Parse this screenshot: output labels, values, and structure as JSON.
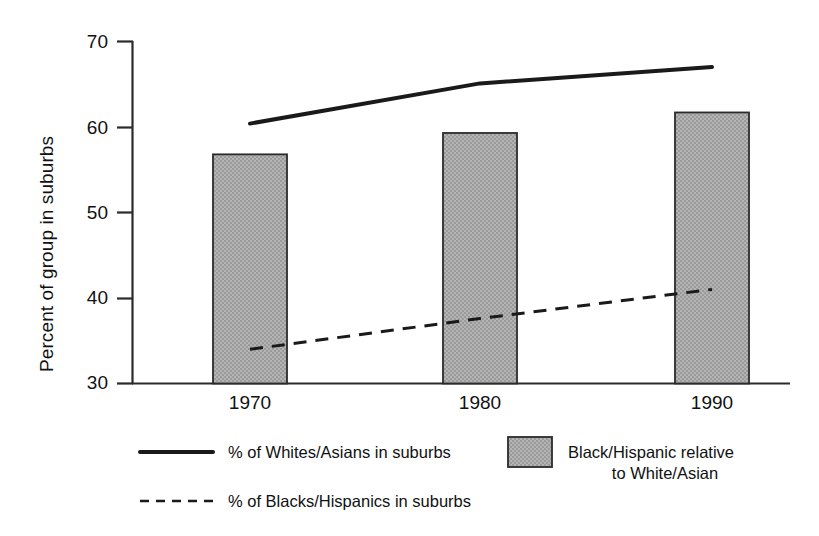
{
  "chart_data": {
    "type": "bar",
    "title": "",
    "subtitle": "",
    "xlabel": "",
    "ylabel": "Percent of group in suburbs",
    "categories": [
      "1970",
      "1980",
      "1990"
    ],
    "ylim": [
      30,
      70
    ],
    "yticks": [
      30,
      40,
      50,
      60,
      70
    ],
    "ytick_labels": [
      "30",
      "40",
      "50",
      "60",
      "70"
    ],
    "grid": false,
    "legend_position": "bottom",
    "series": [
      {
        "name": "Black/Hispanic relative to White/Asian",
        "type": "bar",
        "values": [
          56.8,
          59.3,
          61.7
        ],
        "color": "#a9a9a9"
      },
      {
        "name": "% of Whites/Asians in suburbs",
        "type": "line",
        "style": "solid",
        "values": [
          60.4,
          65.1,
          67.0
        ],
        "color": "#1a1a1a"
      },
      {
        "name": "% of Blacks/Hispanics in suburbs",
        "type": "line",
        "style": "dashed",
        "values": [
          34.0,
          37.6,
          41.0
        ],
        "color": "#1a1a1a"
      }
    ]
  },
  "axes": {
    "ylabel": "Percent of group in suburbs",
    "ytick_70": "70",
    "ytick_60": "60",
    "ytick_50": "50",
    "ytick_40": "40",
    "ytick_30": "30",
    "xtick_1970": "1970",
    "xtick_1980": "1980",
    "xtick_1990": "1990"
  },
  "legend": {
    "entry_solid_line": "% of Whites/Asians in suburbs",
    "entry_dashed_line": "% of Blacks/Hispanics in suburbs",
    "entry_bar_line1": "Black/Hispanic relative",
    "entry_bar_line2": "to White/Asian"
  },
  "colors": {
    "bar_fill": "#a9a9a9",
    "bar_edge": "#2b2b2b",
    "line": "#1a1a1a",
    "axis": "#2b2b2b",
    "background": "#ffffff"
  }
}
